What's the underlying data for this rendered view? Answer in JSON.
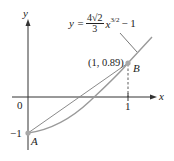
{
  "diagram": {
    "type": "function-graph",
    "axes": {
      "x_label": "x",
      "y_label": "y",
      "origin_label": "0",
      "x_tick_label": "1",
      "y_tick_label": "−1"
    },
    "curve": {
      "equation_lhs": "y =",
      "equation_coef_num": "4√2",
      "equation_coef_den": "3",
      "equation_var": "x",
      "equation_exp": "3/2",
      "equation_tail": "− 1",
      "color": "#9a9a9a"
    },
    "chord": {
      "from": "A",
      "to": "B",
      "color": "#8a8a8a"
    },
    "points": [
      {
        "name": "A",
        "label": "A",
        "coords": [
          0,
          -1
        ]
      },
      {
        "name": "B",
        "label": "B",
        "coords": [
          1,
          0.89
        ],
        "coord_label": "(1, 0.89)"
      }
    ],
    "colors": {
      "axis": "#333333",
      "curve": "#9a9a9a",
      "point": "#a8a8a8",
      "text": "#222222"
    }
  }
}
